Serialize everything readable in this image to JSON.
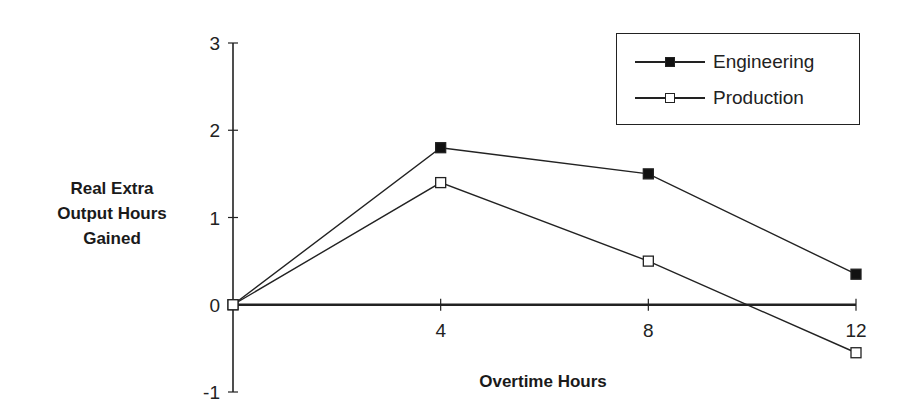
{
  "chart_data": {
    "type": "line",
    "title": "",
    "xlabel": "Overtime Hours",
    "ylabel": "Real Extra Output Hours Gained",
    "ylabel_lines": [
      "Real Extra",
      "Output Hours",
      "Gained"
    ],
    "x": [
      0,
      4,
      8,
      12
    ],
    "x_ticks": [
      "4",
      "8",
      "12"
    ],
    "y_ticks": [
      "3",
      "2",
      "1",
      "0",
      "-1"
    ],
    "xlim": [
      0,
      12
    ],
    "ylim": [
      -1,
      3
    ],
    "grid": false,
    "legend_position": "top-right",
    "series": [
      {
        "name": "Engineering",
        "marker": "filled-square",
        "color": "#111111",
        "values": [
          0,
          1.8,
          1.5,
          0.35
        ]
      },
      {
        "name": "Production",
        "marker": "hollow-square",
        "color": "#111111",
        "values": [
          0,
          1.4,
          0.5,
          -0.55
        ]
      }
    ]
  },
  "legend": {
    "items": [
      {
        "label": "Engineering"
      },
      {
        "label": "Production"
      }
    ]
  }
}
